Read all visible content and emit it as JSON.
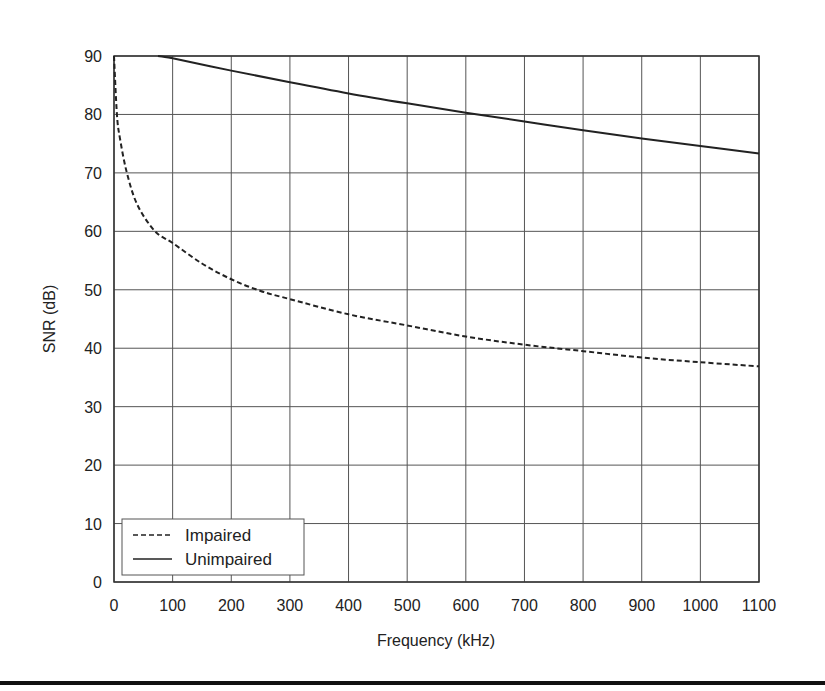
{
  "chart_data": {
    "type": "line",
    "title": "",
    "xlabel": "Frequency (kHz)",
    "ylabel": "SNR (dB)",
    "xlim": [
      0,
      1100
    ],
    "ylim": [
      0,
      90
    ],
    "x_ticks": [
      0,
      100,
      200,
      300,
      400,
      500,
      600,
      700,
      800,
      900,
      1000,
      1100
    ],
    "y_ticks": [
      0,
      10,
      20,
      30,
      40,
      50,
      60,
      70,
      80,
      90
    ],
    "grid": true,
    "legend_position": "lower left",
    "series": [
      {
        "name": "Impaired",
        "style": "dashed",
        "x": [
          0,
          5,
          10,
          22,
          40,
          70,
          100,
          150,
          200,
          250,
          300,
          400,
          500,
          600,
          700,
          800,
          900,
          1000,
          1100
        ],
        "y": [
          90,
          80,
          76,
          70,
          64.5,
          60,
          58,
          54.5,
          51.8,
          49.8,
          48.4,
          45.8,
          43.9,
          42.0,
          40.6,
          39.5,
          38.4,
          37.6,
          36.9
        ]
      },
      {
        "name": "Unimpaired",
        "style": "solid",
        "x": [
          75,
          100,
          200,
          300,
          400,
          500,
          600,
          700,
          800,
          900,
          1000,
          1100
        ],
        "y": [
          90,
          89.6,
          87.5,
          85.5,
          83.6,
          81.9,
          80.3,
          78.8,
          77.3,
          75.9,
          74.6,
          73.3
        ]
      }
    ]
  },
  "legend": {
    "items": [
      {
        "label": "Impaired",
        "style": "dashed"
      },
      {
        "label": "Unimpaired",
        "style": "solid"
      }
    ]
  },
  "colors": {
    "line": "#222222",
    "grid": "#444444",
    "background": "#ffffff"
  }
}
